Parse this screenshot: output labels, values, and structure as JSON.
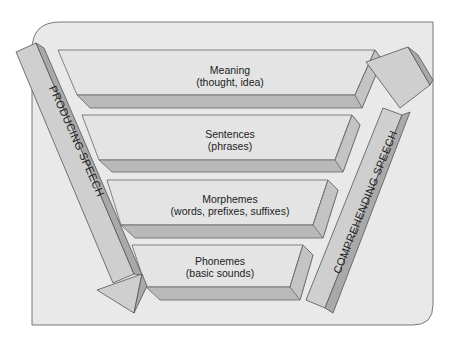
{
  "diagram": {
    "levels": [
      {
        "title": "Meaning",
        "subtitle": "(thought, idea)"
      },
      {
        "title": "Sentences",
        "subtitle": "(phrases)"
      },
      {
        "title": "Morphemes",
        "subtitle": "(words, prefixes, suffixes)"
      },
      {
        "title": "Phonemes",
        "subtitle": "(basic sounds)"
      }
    ],
    "left_arrow": {
      "label": "PRODUCING SPEECH",
      "direction": "down"
    },
    "right_arrow": {
      "label": "COMPREHENDING SPEECH",
      "direction": "up"
    },
    "colors": {
      "panel": "#e9e9e9",
      "slab_face": "#e4e4e4",
      "slab_shadow": "#b9b9b9",
      "arrow_face": "#cfcfcf",
      "arrow_side": "#a9a9a9",
      "outline": "#555555"
    }
  }
}
